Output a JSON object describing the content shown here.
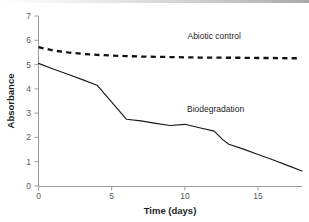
{
  "chart_data": {
    "type": "line",
    "title": "",
    "xlabel": "Time (days)",
    "ylabel": "Absorbance",
    "xlim": [
      0,
      18
    ],
    "ylim": [
      0,
      7
    ],
    "xticks": [
      0,
      5,
      10,
      15
    ],
    "yticks": [
      0,
      1,
      2,
      3,
      4,
      5,
      6,
      7
    ],
    "grid": false,
    "legend_position": "inline-annotations",
    "series": [
      {
        "name": "Abiotic control",
        "style": "dashed",
        "color": "#111111",
        "label_x": 12.0,
        "label_y": 6.05,
        "x": [
          0,
          1,
          2,
          3,
          4,
          5,
          6,
          7,
          8,
          9,
          10,
          11,
          12,
          13,
          14,
          15,
          16,
          17,
          17.7
        ],
        "y": [
          5.72,
          5.58,
          5.5,
          5.44,
          5.4,
          5.37,
          5.35,
          5.33,
          5.32,
          5.31,
          5.3,
          5.29,
          5.29,
          5.28,
          5.28,
          5.27,
          5.27,
          5.26,
          5.26
        ]
      },
      {
        "name": "Biodegradation",
        "style": "solid",
        "color": "#1a1a1a",
        "label_x": 12.1,
        "label_y": 3.05,
        "x": [
          0,
          1,
          2,
          3,
          4,
          5,
          6,
          7,
          8,
          9,
          10,
          11,
          12,
          12.6,
          13,
          14,
          15,
          16,
          17,
          18
        ],
        "y": [
          5.05,
          4.82,
          4.6,
          4.38,
          4.15,
          3.45,
          2.75,
          2.68,
          2.58,
          2.49,
          2.54,
          2.4,
          2.26,
          1.9,
          1.72,
          1.52,
          1.3,
          1.08,
          0.85,
          0.62
        ]
      }
    ]
  },
  "labels": {
    "ylabel": "Absorbance",
    "xlabel": "Time (days)",
    "series_abiotic": "Abiotic control",
    "series_biodeg": "Biodegradation",
    "ytick_0": "0",
    "ytick_1": "1",
    "ytick_2": "2",
    "ytick_3": "3",
    "ytick_4": "4",
    "ytick_5": "5",
    "ytick_6": "6",
    "ytick_7": "7",
    "xtick_0": "0",
    "xtick_5": "5",
    "xtick_10": "10",
    "xtick_15": "15"
  }
}
